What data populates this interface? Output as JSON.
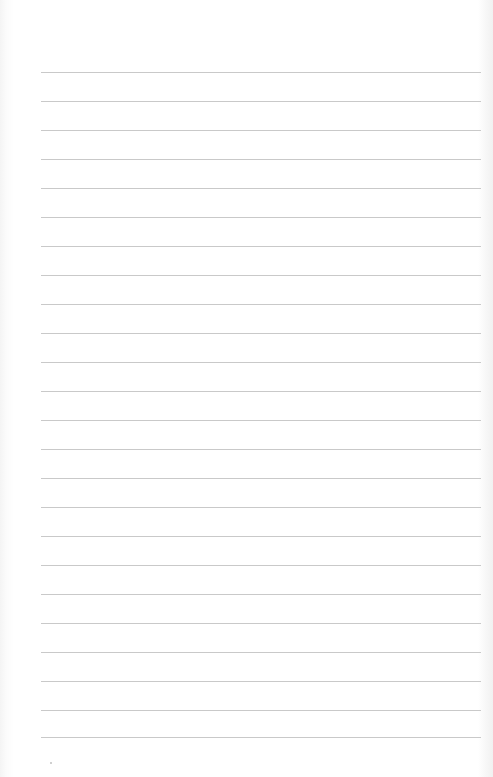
{
  "page": {
    "type": "lined-notebook-page",
    "line_count": 24,
    "line_color": "#c9c9c9",
    "background": "#ffffff",
    "line_positions_y": [
      72,
      101,
      130,
      159,
      188,
      217,
      246,
      275,
      304,
      333,
      362,
      391,
      420,
      449,
      478,
      507,
      536,
      565,
      594,
      623,
      652,
      681,
      710,
      737
    ]
  }
}
